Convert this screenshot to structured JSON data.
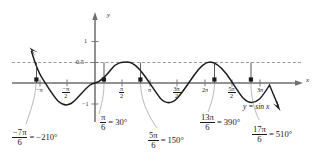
{
  "figure": {
    "type": "cartesian-graph",
    "curve_label": "y = sin x",
    "axes": {
      "x_axis_label": "x",
      "y_axis_label": "y",
      "x_ticks": [
        "-π",
        "-π/2",
        "π/2",
        "π",
        "3π/2",
        "2π",
        "5π/2",
        "3π"
      ],
      "y_ticks": [
        "1",
        "0.5",
        "-1"
      ]
    },
    "x_tick_labels": [
      {
        "num": "",
        "den": "",
        "single": "−π"
      },
      {
        "num": "−π",
        "den": "2",
        "single": ""
      },
      {
        "num": "π",
        "den": "2",
        "single": ""
      },
      {
        "num": "",
        "den": "",
        "single": "π"
      },
      {
        "num": "3π",
        "den": "2",
        "single": ""
      },
      {
        "num": "",
        "den": "",
        "single": "2π"
      },
      {
        "num": "5π",
        "den": "2",
        "single": ""
      },
      {
        "num": "",
        "den": "",
        "single": "3π"
      }
    ],
    "y_tick_one": "1",
    "y_tick_half": "0.5",
    "y_tick_neg_one": "−1",
    "dashed_line_value": "0.5",
    "callouts": [
      {
        "num": "−7π",
        "den": "6",
        "eq": "=",
        "deg": "−210°"
      },
      {
        "num": "π",
        "den": "6",
        "eq": "=",
        "deg": "30°"
      },
      {
        "num": "5π",
        "den": "6",
        "eq": "=",
        "deg": "150°"
      },
      {
        "num": "13π",
        "den": "6",
        "eq": "=",
        "deg": "390°"
      },
      {
        "num": "17π",
        "den": "6",
        "eq": "=",
        "deg": "510°"
      }
    ],
    "colors": {
      "curve": "#1a1a1a",
      "axis": "#6e6e6e",
      "dashed": "#6e6e6e",
      "text": "#1a1a1a"
    }
  }
}
